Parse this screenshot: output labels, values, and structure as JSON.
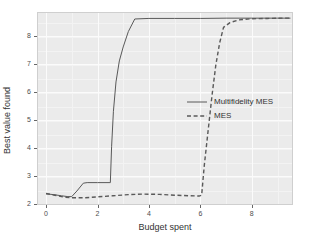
{
  "chart_data": {
    "type": "line",
    "title": "",
    "xlabel": "Budget spent",
    "ylabel": "Best value found",
    "xlim": [
      -0.35,
      9.6
    ],
    "ylim": [
      1.95,
      8.85
    ],
    "xticks": [
      0,
      2,
      4,
      6,
      8
    ],
    "yticks": [
      2,
      3,
      4,
      5,
      6,
      7,
      8
    ],
    "xtick_labels": [
      "0",
      "2",
      "4",
      "6",
      "8"
    ],
    "ytick_labels": [
      "2",
      "3",
      "4",
      "5",
      "6",
      "7",
      "8"
    ],
    "grid": true,
    "grid_color": "#fbfbfb",
    "panel_background": "#ebebeb",
    "legend_position": "center-right",
    "series": [
      {
        "name": "Multifidelity MES",
        "style": "solid",
        "color": "#595959",
        "points": [
          [
            0.0,
            2.35
          ],
          [
            0.3,
            2.32
          ],
          [
            0.6,
            2.28
          ],
          [
            0.85,
            2.25
          ],
          [
            1.0,
            2.25
          ],
          [
            1.2,
            2.45
          ],
          [
            1.45,
            2.73
          ],
          [
            1.6,
            2.75
          ],
          [
            2.0,
            2.75
          ],
          [
            2.45,
            2.75
          ],
          [
            2.5,
            2.75
          ],
          [
            2.55,
            4.05
          ],
          [
            2.62,
            5.3
          ],
          [
            2.72,
            6.35
          ],
          [
            2.85,
            7.1
          ],
          [
            3.0,
            7.6
          ],
          [
            3.2,
            8.15
          ],
          [
            3.45,
            8.6
          ],
          [
            4.0,
            8.62
          ],
          [
            5.0,
            8.62
          ],
          [
            6.0,
            8.62
          ],
          [
            7.0,
            8.63
          ],
          [
            8.0,
            8.63
          ],
          [
            9.0,
            8.63
          ],
          [
            9.5,
            8.63
          ]
        ]
      },
      {
        "name": "MES",
        "style": "dashed",
        "color": "#595959",
        "points": [
          [
            0.0,
            2.36
          ],
          [
            0.35,
            2.3
          ],
          [
            0.7,
            2.23
          ],
          [
            1.0,
            2.21
          ],
          [
            1.5,
            2.21
          ],
          [
            2.0,
            2.24
          ],
          [
            2.6,
            2.28
          ],
          [
            3.2,
            2.32
          ],
          [
            3.8,
            2.34
          ],
          [
            4.4,
            2.33
          ],
          [
            5.0,
            2.3
          ],
          [
            5.6,
            2.28
          ],
          [
            5.95,
            2.27
          ],
          [
            6.05,
            2.3
          ],
          [
            6.15,
            3.35
          ],
          [
            6.3,
            4.6
          ],
          [
            6.45,
            5.85
          ],
          [
            6.6,
            6.95
          ],
          [
            6.75,
            7.75
          ],
          [
            6.9,
            8.3
          ],
          [
            7.15,
            8.47
          ],
          [
            7.5,
            8.57
          ],
          [
            8.0,
            8.61
          ],
          [
            8.6,
            8.62
          ],
          [
            9.2,
            8.63
          ],
          [
            9.5,
            8.63
          ]
        ]
      }
    ],
    "legend_entries": [
      {
        "label": "Multifidelity MES",
        "style": "solid"
      },
      {
        "label": "MES",
        "style": "dashed"
      }
    ]
  }
}
